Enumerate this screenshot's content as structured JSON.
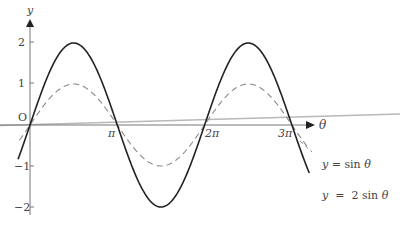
{
  "chart_data": {
    "type": "line",
    "title": "",
    "xlabel": "θ",
    "ylabel": "y",
    "origin_label": "O",
    "x_ticks": [
      {
        "value": 3.14159,
        "label": "π"
      },
      {
        "value": 6.28319,
        "label": "2π"
      },
      {
        "value": 9.42478,
        "label": "3π"
      }
    ],
    "y_ticks": [
      {
        "value": 2,
        "label": "2"
      },
      {
        "value": 1,
        "label": "1"
      },
      {
        "value": -1,
        "label": "−1"
      },
      {
        "value": -2,
        "label": "−2"
      }
    ],
    "xlim": [
      -0.4,
      10.3
    ],
    "ylim": [
      -2.2,
      2.5
    ],
    "grid": false,
    "series": [
      {
        "name": "y = sin θ",
        "style": "dashed",
        "color": "#888888",
        "function": "sin(x)",
        "x": [
          0,
          1.5708,
          3.1416,
          4.7124,
          6.2832,
          7.854,
          9.4248
        ],
        "values": [
          0,
          1,
          0,
          -1,
          0,
          1,
          0
        ]
      },
      {
        "name": "y = 2 sin θ",
        "style": "solid",
        "color": "#222222",
        "function": "2*sin(x)",
        "x": [
          0,
          1.5708,
          3.1416,
          4.7124,
          6.2832,
          7.854,
          9.4248
        ],
        "values": [
          0,
          2,
          0,
          -2,
          0,
          2,
          0
        ]
      }
    ],
    "legend": [
      {
        "label_prefix": "y",
        "label_eq": " = ",
        "label_fn": "sin ",
        "label_var": "θ"
      },
      {
        "label_prefix": "y",
        "label_eq": "  =  ",
        "label_fn": "2 sin ",
        "label_var": "θ"
      }
    ],
    "legend_position": "right-inline"
  }
}
